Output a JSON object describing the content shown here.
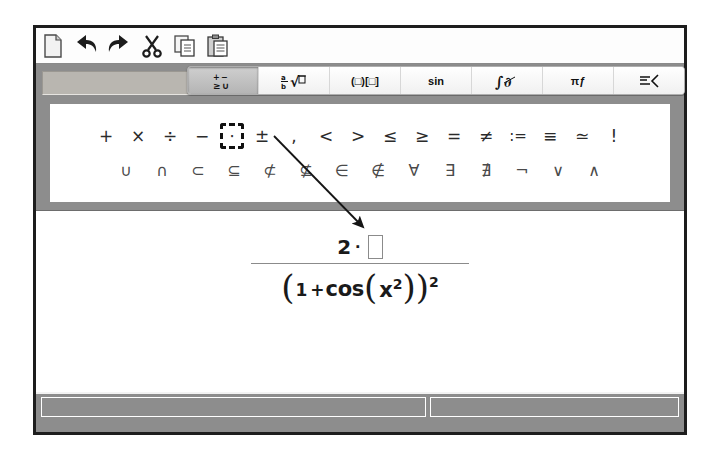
{
  "app": {
    "name": "formula-editor"
  },
  "toolbar": {
    "buttons": [
      {
        "name": "new-document-icon",
        "label": "New"
      },
      {
        "name": "undo-icon",
        "label": "Undo"
      },
      {
        "name": "redo-icon",
        "label": "Redo"
      },
      {
        "name": "cut-icon",
        "label": "Cut"
      },
      {
        "name": "copy-icon",
        "label": "Copy"
      },
      {
        "name": "paste-icon",
        "label": "Paste"
      }
    ]
  },
  "category_tabs": {
    "selected_index": 0,
    "items": [
      {
        "name": "tab-unary-binary-operators",
        "label": "±∪",
        "icon": "plus-minus-union-icon"
      },
      {
        "name": "tab-fractions-roots",
        "label": "½√□",
        "icon": "fraction-root-icon"
      },
      {
        "name": "tab-brackets",
        "label": "(□)[□]",
        "icon": "brackets-icon"
      },
      {
        "name": "tab-functions",
        "label": "sin",
        "icon": "sin-icon"
      },
      {
        "name": "tab-calculus",
        "label": "∫",
        "icon": "integral-icon"
      },
      {
        "name": "tab-greek-characters",
        "label": "πƒ",
        "icon": "greek-pi-icon"
      },
      {
        "name": "tab-formats-attributes",
        "label": "☰‹",
        "icon": "format-attributes-icon"
      }
    ]
  },
  "symbol_palette": {
    "row1": [
      {
        "name": "symbol-plus",
        "glyph": "+",
        "selected": false
      },
      {
        "name": "symbol-times",
        "glyph": "×",
        "selected": false
      },
      {
        "name": "symbol-divide",
        "glyph": "÷",
        "selected": false
      },
      {
        "name": "symbol-minus",
        "glyph": "−",
        "selected": false
      },
      {
        "name": "symbol-dot-multiplication",
        "glyph": "⋅",
        "selected": true
      },
      {
        "name": "symbol-plus-minus",
        "glyph": "±",
        "selected": false
      },
      {
        "name": "symbol-comma",
        "glyph": ",",
        "selected": false
      },
      {
        "name": "symbol-less-than",
        "glyph": "<",
        "selected": false
      },
      {
        "name": "symbol-greater-than",
        "glyph": ">",
        "selected": false
      },
      {
        "name": "symbol-less-or-equal",
        "glyph": "≤",
        "selected": false
      },
      {
        "name": "symbol-greater-or-equal",
        "glyph": "≥",
        "selected": false
      },
      {
        "name": "symbol-equal",
        "glyph": "=",
        "selected": false
      },
      {
        "name": "symbol-not-equal",
        "glyph": "≠",
        "selected": false
      },
      {
        "name": "symbol-definition",
        "glyph": ":=",
        "selected": false
      },
      {
        "name": "symbol-identical",
        "glyph": "≡",
        "selected": false
      },
      {
        "name": "symbol-similar",
        "glyph": "≃",
        "selected": false
      },
      {
        "name": "symbol-factorial",
        "glyph": "!",
        "selected": false
      }
    ],
    "row2": [
      {
        "name": "symbol-union",
        "glyph": "∪"
      },
      {
        "name": "symbol-intersection",
        "glyph": "∩"
      },
      {
        "name": "symbol-subset",
        "glyph": "⊂"
      },
      {
        "name": "symbol-subset-or-equal",
        "glyph": "⊆"
      },
      {
        "name": "symbol-not-subset",
        "glyph": "⊄"
      },
      {
        "name": "symbol-not-subset-or-equal",
        "glyph": "⊈"
      },
      {
        "name": "symbol-element-of",
        "glyph": "∈"
      },
      {
        "name": "symbol-not-element-of",
        "glyph": "∉"
      },
      {
        "name": "symbol-for-all",
        "glyph": "∀"
      },
      {
        "name": "symbol-exists",
        "glyph": "∃"
      },
      {
        "name": "symbol-not-exists",
        "glyph": "∄"
      },
      {
        "name": "symbol-not",
        "glyph": "¬"
      },
      {
        "name": "symbol-or",
        "glyph": "∨"
      },
      {
        "name": "symbol-and",
        "glyph": "∧"
      }
    ]
  },
  "canvas": {
    "formula": {
      "numerator": {
        "coefficient": "2",
        "operator": "⋅",
        "placeholder": ""
      },
      "denominator": {
        "open_paren": "(",
        "one": "1",
        "plus": "+",
        "function": "cos",
        "inner_open": "(",
        "variable": "x",
        "inner_exponent": "2",
        "inner_close": ")",
        "close_paren": ")",
        "exponent": "2"
      }
    }
  },
  "status_bar": {
    "left_pane": "",
    "right_pane": ""
  },
  "annotation": {
    "arrow": {
      "from_name": "symbol-dot-multiplication",
      "to_name": "formula-numerator",
      "color": "#151515"
    }
  },
  "colors": {
    "frame": "#1d1d1d",
    "chrome_gray": "#8d8d8d",
    "toolbar_bg": "#fdfdfd",
    "canvas_bg": "#ffffff",
    "text": "#1a1a1a"
  }
}
